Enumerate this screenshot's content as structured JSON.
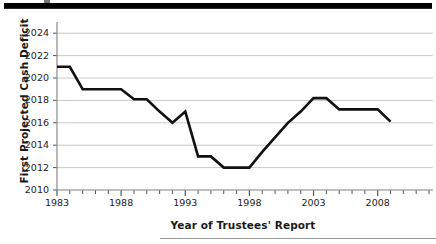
{
  "figure": {
    "top_rule": "thick-black-rule",
    "bottom_rule": "thin-grey-rule"
  },
  "chart_data": {
    "type": "line",
    "title": "",
    "xlabel": "Year of Trustees' Report",
    "ylabel": "First Projected Cash Deficit",
    "xlim": [
      1983,
      2012
    ],
    "ylim": [
      2010,
      2025
    ],
    "grid": "horizontal",
    "legend": "none",
    "line_color": "#111111",
    "x": [
      1983,
      1984,
      1985,
      1986,
      1987,
      1988,
      1989,
      1990,
      1991,
      1992,
      1993,
      1994,
      1995,
      1996,
      1997,
      1998,
      1999,
      2000,
      2001,
      2002,
      2003,
      2004,
      2005,
      2006,
      2007,
      2008,
      2009
    ],
    "values": [
      2021,
      2021,
      2019,
      2019,
      2019,
      2019,
      2018.1,
      2018.1,
      2017,
      2016,
      2017,
      2013,
      2013,
      2012,
      2012,
      2012,
      2013.4,
      2014.7,
      2016,
      2017,
      2018.2,
      2018.2,
      2017.2,
      2017.2,
      2017.2,
      2017.2,
      2016.1
    ],
    "ytick_labels": [
      "2010",
      "2012",
      "2014",
      "2016",
      "2018",
      "2020",
      "2022",
      "2024"
    ],
    "ytick_values": [
      2010,
      2012,
      2014,
      2016,
      2018,
      2020,
      2022,
      2024
    ],
    "xtick_labels": [
      "1983",
      "1988",
      "1993",
      "1998",
      "2003",
      "2008"
    ],
    "xtick_values": [
      1983,
      1988,
      1993,
      1998,
      2003,
      2008
    ],
    "minor_xticks": "every-year"
  }
}
